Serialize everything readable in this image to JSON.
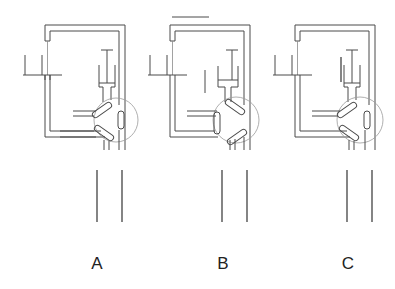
{
  "figure": {
    "panels": [
      {
        "id": "A",
        "label": "A",
        "x_offset": 0,
        "top_bar": false,
        "side_marker": "none",
        "valve_state": "standard"
      },
      {
        "id": "B",
        "label": "B",
        "x_offset": 125,
        "top_bar": true,
        "side_marker": "left-of-syringe",
        "valve_state": "rotated"
      },
      {
        "id": "C",
        "label": "C",
        "x_offset": 250,
        "top_bar": false,
        "side_marker": "syringe-left-wall",
        "valve_state": "standard"
      }
    ]
  },
  "colors": {
    "line": "#4a4a4a",
    "circle": "#9a9a9a",
    "background": "#ffffff"
  }
}
